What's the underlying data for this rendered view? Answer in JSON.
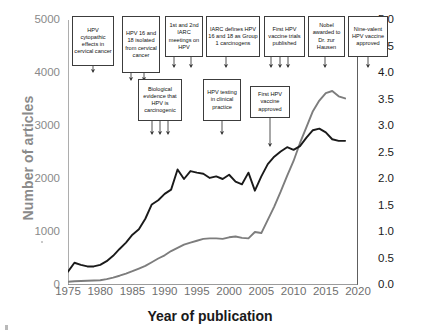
{
  "chart_data": {
    "type": "line",
    "title": "",
    "subtitle": "",
    "xlabel": "Year of publication",
    "ylabel": "Number of articles",
    "ylabel_right": "Rate per 1000 articles",
    "xlim": [
      1975,
      2020
    ],
    "ylim": [
      0,
      5000
    ],
    "ylim_right": [
      0.0,
      5.0
    ],
    "grid": false,
    "legend_position": "none",
    "xticks": [
      "1975",
      "1980",
      "1985",
      "1990",
      "1995",
      "2000",
      "2005",
      "2010",
      "2015",
      "2020"
    ],
    "yticks_left": [
      "0",
      "1000",
      "2000",
      "3000",
      "4000",
      "5000"
    ],
    "yticks_right": [
      "0.0",
      "0.5",
      "1.0",
      "1.5",
      "2.0",
      "2.5",
      "3.0",
      "3.5",
      "4.0",
      "4.5",
      "5.0"
    ],
    "x": [
      1975,
      1976,
      1977,
      1978,
      1979,
      1980,
      1981,
      1982,
      1983,
      1984,
      1985,
      1986,
      1987,
      1988,
      1989,
      1990,
      1991,
      1992,
      1993,
      1994,
      1995,
      1996,
      1997,
      1998,
      1999,
      2000,
      2001,
      2002,
      2003,
      2004,
      2005,
      2006,
      2007,
      2008,
      2009,
      2010,
      2011,
      2012,
      2013,
      2014,
      2015,
      2016,
      2017,
      2018
    ],
    "series": [
      {
        "name": "Number of articles",
        "axis": "left",
        "color": "#7d7d7d",
        "values": [
          60,
          70,
          75,
          80,
          85,
          90,
          110,
          140,
          175,
          215,
          260,
          310,
          360,
          430,
          500,
          560,
          640,
          700,
          760,
          800,
          835,
          870,
          880,
          880,
          870,
          900,
          915,
          890,
          880,
          1000,
          980,
          1230,
          1480,
          1760,
          2060,
          2340,
          2680,
          2980,
          3280,
          3480,
          3620,
          3660,
          3560,
          3520
        ]
      },
      {
        "name": "Rate per 1000 articles",
        "axis": "right",
        "color": "#1a1a1a",
        "values": [
          0.25,
          0.42,
          0.38,
          0.35,
          0.35,
          0.38,
          0.45,
          0.55,
          0.68,
          0.8,
          0.95,
          1.05,
          1.25,
          1.52,
          1.6,
          1.72,
          1.8,
          2.18,
          2.0,
          2.15,
          2.12,
          2.1,
          2.02,
          2.05,
          2.0,
          2.08,
          1.95,
          1.9,
          2.12,
          1.78,
          2.05,
          2.28,
          2.42,
          2.52,
          2.6,
          2.55,
          2.62,
          2.78,
          2.92,
          2.95,
          2.88,
          2.75,
          2.72,
          2.72
        ]
      }
    ],
    "annotations": [
      {
        "id": "hpv-cytopathic-effects",
        "text": "HPV cytopathic effects in cervical cancer",
        "box": {
          "x": 72,
          "y": 16,
          "w": 42,
          "h": 50
        },
        "arrows": [
          {
            "x": 93,
            "y_end": 72
          }
        ]
      },
      {
        "id": "hpv-16-18-isolated",
        "text": "HPV 16 and 18 isolated from cervical cancer",
        "box": {
          "x": 122,
          "y": 16,
          "w": 38,
          "h": 57
        },
        "arrows": [
          {
            "x": 131,
            "y_end": 80
          },
          {
            "x": 144,
            "y_end": 80
          }
        ]
      },
      {
        "id": "iarc-meetings",
        "text": "1st and 2nd IARC meetings on HPV",
        "box": {
          "x": 165,
          "y": 16,
          "w": 38,
          "h": 41
        },
        "arrows": [
          {
            "x": 174,
            "y_end": 67
          },
          {
            "x": 191,
            "y_end": 67
          }
        ]
      },
      {
        "id": "iarc-defines-group1",
        "text": "IARC defines HPV 16 and 18 as Group 1 carcinogens",
        "box": {
          "x": 206,
          "y": 16,
          "w": 54,
          "h": 41
        },
        "arrows": [
          {
            "x": 226,
            "y_end": 67
          }
        ]
      },
      {
        "id": "first-hpv-vaccine-trials",
        "text": "First HPV vaccine trials published",
        "box": {
          "x": 264,
          "y": 16,
          "w": 41,
          "h": 41
        },
        "arrows": [
          {
            "x": 271,
            "y_end": 67
          },
          {
            "x": 280,
            "y_end": 67
          },
          {
            "x": 288,
            "y_end": 67
          }
        ]
      },
      {
        "id": "nobel-zur-hausen",
        "text": "Nobel awarded to Dr. zur Hausen",
        "box": {
          "x": 308,
          "y": 16,
          "w": 37,
          "h": 41
        },
        "arrows": [
          {
            "x": 325,
            "y_end": 67
          }
        ]
      },
      {
        "id": "nine-valent-vaccine",
        "text": "Nine-valent HPV vaccine approved",
        "box": {
          "x": 348,
          "y": 16,
          "w": 40,
          "h": 41
        },
        "arrows": [
          {
            "x": 368,
            "y_end": 67
          }
        ]
      },
      {
        "id": "biological-evidence-carcinogenic",
        "text": "Biological evidence that HPV is carcinogenic",
        "box": {
          "x": 138,
          "y": 79,
          "w": 44,
          "h": 42
        },
        "arrows": [
          {
            "x": 152,
            "y_end": 134
          },
          {
            "x": 160,
            "y_end": 134
          },
          {
            "x": 168,
            "y_end": 134
          }
        ]
      },
      {
        "id": "hpv-testing-clinical-practice",
        "text": "HPV testing in clinical practice",
        "box": {
          "x": 203,
          "y": 79,
          "w": 38,
          "h": 42
        },
        "arrows": [
          {
            "x": 222,
            "y_end": 134
          }
        ]
      },
      {
        "id": "first-hpv-vaccine-approved",
        "text": "First HPV vaccine approved",
        "box": {
          "x": 250,
          "y": 86,
          "w": 40,
          "h": 32
        },
        "arrows": [
          {
            "x": 270,
            "y_end": 146
          }
        ]
      }
    ]
  },
  "axes": {
    "left_title": "Number of articles",
    "right_title": "Rate per 1000 articles",
    "bottom_title": "Year of publication"
  },
  "colors": {
    "left_axis": "#8a8a8a",
    "right_axis": "#1a1a1a",
    "series_count": "#7d7d7d",
    "series_rate": "#1a1a1a",
    "annotation_border": "#3c3c3c",
    "background": "#ffffff"
  }
}
